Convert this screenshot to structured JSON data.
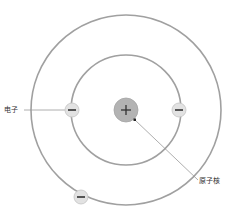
{
  "diagram": {
    "center": {
      "x": 126,
      "y": 110
    },
    "orbits": [
      {
        "name": "inner-orbit",
        "r": 55
      },
      {
        "name": "outer-orbit",
        "r": 95
      }
    ],
    "nucleus": {
      "r": 12,
      "symbol": "+",
      "fill": "#b3b3b3"
    },
    "electrons": [
      {
        "x": 72,
        "y": 110,
        "symbol": "−"
      },
      {
        "x": 179,
        "y": 110,
        "symbol": "−"
      },
      {
        "x": 81,
        "y": 197,
        "symbol": "−"
      }
    ],
    "colors": {
      "orbit": "#9e9e9e",
      "electron_fill": "#e2e2e2",
      "electron_stroke": "#bdbdbd",
      "leader": "#888888"
    }
  },
  "labels": {
    "electron": "电子",
    "nucleus": "原子核"
  }
}
